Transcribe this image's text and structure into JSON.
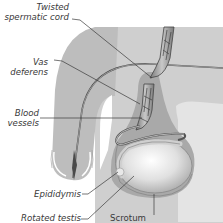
{
  "diagram": {
    "labels": {
      "twisted_cord_line1": "Twisted",
      "twisted_cord_line2": "spermatic cord",
      "vas_line1": "Vas",
      "vas_line2": "deferens",
      "blood_line1": "Blood",
      "blood_line2": "vessels",
      "epididymis": "Epididymis",
      "rotated_testis": "Rotated testis",
      "scrotum": "Scrotum"
    },
    "colors": {
      "background": "#ffffff",
      "body_fill": "#bdbdbd",
      "body_light": "#d6d6d6",
      "scrotum_fill": "#a9a9a9",
      "testis_fill": "#e6e6e6",
      "outline": "#5a5a5a",
      "label_text": "#3a3a3a",
      "leader_line": "#3a3a3a"
    }
  }
}
